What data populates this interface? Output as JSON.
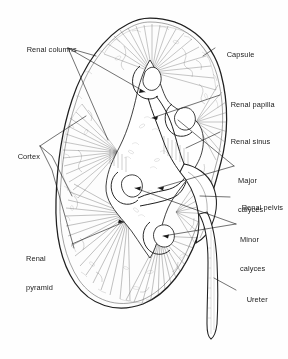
{
  "figure": {
    "style": "line-art anatomical illustration",
    "background_color": "#fefefe",
    "ink_color": "#1a1a1a",
    "shading_color": "#7a7a7a"
  },
  "labels": [
    {
      "id": "renal-columns",
      "text": "Renal columns",
      "lines": [
        "Renal columns"
      ],
      "side": "left",
      "x": 18,
      "y": 36
    },
    {
      "id": "capsule",
      "text": "Capsule",
      "lines": [
        "Capsule"
      ],
      "side": "right",
      "x": 218,
      "y": 41
    },
    {
      "id": "renal-papilla",
      "text": "Renal papilla",
      "lines": [
        "Renal papilla"
      ],
      "side": "right",
      "x": 222,
      "y": 91
    },
    {
      "id": "renal-sinus",
      "text": "Renal sinus",
      "lines": [
        "Renal sinus"
      ],
      "side": "right",
      "x": 222,
      "y": 128
    },
    {
      "id": "major-calyces",
      "text": "Major calyces",
      "lines": [
        "Major",
        "calyces"
      ],
      "side": "right",
      "x": 238,
      "y": 157
    },
    {
      "id": "renal-pelvis",
      "text": "Renal pelvis",
      "lines": [
        "Renal pelvis"
      ],
      "side": "right",
      "x": 233,
      "y": 194
    },
    {
      "id": "minor-calyces",
      "text": "Minor calyces",
      "lines": [
        "Minor",
        "calyces"
      ],
      "side": "right",
      "x": 240,
      "y": 216
    },
    {
      "id": "ureter",
      "text": "Ureter",
      "lines": [
        "Ureter"
      ],
      "side": "right",
      "x": 238,
      "y": 286
    },
    {
      "id": "cortex",
      "text": "Cortex",
      "lines": [
        "Cortex"
      ],
      "side": "left",
      "x": 9,
      "y": 143
    },
    {
      "id": "renal-pyramid",
      "text": "Renal pyramid",
      "lines": [
        "Renal",
        "pyramid"
      ],
      "side": "left",
      "x": 26,
      "y": 235
    }
  ]
}
